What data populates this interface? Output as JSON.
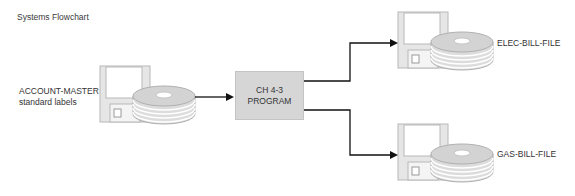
{
  "title": "Systems Flowchart",
  "input_file": {
    "icon": "floppy-disk-pack-icon",
    "label_line1": "ACCOUNT-MASTER",
    "label_line2": "standard labels"
  },
  "process": {
    "label_line1": "CH 4-3",
    "label_line2": "PROGRAM"
  },
  "outputs": [
    {
      "icon": "floppy-disk-pack-icon",
      "label": "ELEC-BILL-FILE"
    },
    {
      "icon": "floppy-disk-pack-icon",
      "label": "GAS-BILL-FILE"
    }
  ],
  "colors": {
    "icon_fill": "#e4e4e4",
    "icon_stroke": "#b5b5b5",
    "process_fill": "#d6d6d6",
    "connector": "#111111"
  }
}
